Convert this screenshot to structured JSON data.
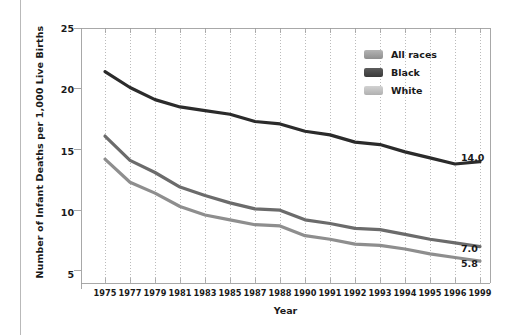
{
  "chart_data": {
    "type": "line",
    "title": "",
    "xlabel": "Year",
    "ylabel": "Number of Infant Deaths per 1,000 Live Births",
    "categories": [
      "1975",
      "1977",
      "1979",
      "1981",
      "1983",
      "1985",
      "1987",
      "1988",
      "1990",
      "1991",
      "1992",
      "1993",
      "1994",
      "1995",
      "1996",
      "1999"
    ],
    "xtick_labels": [
      "1975",
      "1977",
      "1979",
      "1981",
      "1983",
      "1985",
      "1987",
      "1988",
      "1990",
      "1991",
      "1992",
      "1993",
      "1994",
      "1995",
      "1996",
      "1999"
    ],
    "ytick_labels": [
      "5",
      "10",
      "15",
      "20",
      "25"
    ],
    "ytick_values": [
      5,
      10,
      15,
      20,
      25
    ],
    "ylim": [
      4.0,
      25.0
    ],
    "grid": "vertical-dotted",
    "legend_position": "top-right",
    "series": [
      {
        "name": "All races",
        "color": "#6b6b6b",
        "values": [
          16.1,
          14.1,
          13.1,
          11.9,
          11.2,
          10.6,
          10.1,
          10.0,
          9.2,
          8.9,
          8.5,
          8.4,
          8.0,
          7.6,
          7.3,
          7.0
        ],
        "end_label": "7.0"
      },
      {
        "name": "Black",
        "color": "#2b2b2b",
        "values": [
          21.4,
          20.1,
          19.1,
          18.5,
          18.2,
          17.9,
          17.3,
          17.1,
          16.5,
          16.2,
          15.6,
          15.4,
          14.8,
          14.3,
          13.8,
          14.0
        ],
        "end_label": "14.0"
      },
      {
        "name": "White",
        "color": "#8e8e8e",
        "values": [
          14.2,
          12.3,
          11.4,
          10.3,
          9.6,
          9.2,
          8.8,
          8.7,
          7.9,
          7.6,
          7.2,
          7.1,
          6.8,
          6.4,
          6.1,
          5.8
        ],
        "end_label": "5.8"
      }
    ],
    "end_labels": [
      {
        "text": "14.0",
        "series": "Black"
      },
      {
        "text": "7.0",
        "series": "All races"
      },
      {
        "text": "5.8",
        "series": "White"
      }
    ]
  },
  "legend": {
    "items": [
      {
        "label": "All races",
        "color": "#9a9a9a"
      },
      {
        "label": "Black",
        "color": "#484848",
        "swatch_note": "dark"
      },
      {
        "label": "White",
        "color": "#bdbdbd"
      }
    ]
  },
  "axes": {
    "y_title": "Number of Infant Deaths per 1,000 Live Births",
    "x_title": "Year",
    "y_ticks": [
      "25",
      "20",
      "15",
      "10",
      "5"
    ],
    "x_ticks": [
      "1975",
      "1977",
      "1979",
      "1981",
      "1983",
      "1985",
      "1987",
      "1988",
      "1990",
      "1991",
      "1992",
      "1993",
      "1994",
      "1995",
      "1996",
      "1999"
    ]
  },
  "annotations": {
    "black_end": "14.0",
    "all_races_end": "7.0",
    "white_end": "5.8"
  },
  "colors": {
    "plot_border": "#9e9e9e",
    "gridline": "#9e9e9e",
    "text": "#1a1a1a",
    "background": "#ffffff"
  }
}
